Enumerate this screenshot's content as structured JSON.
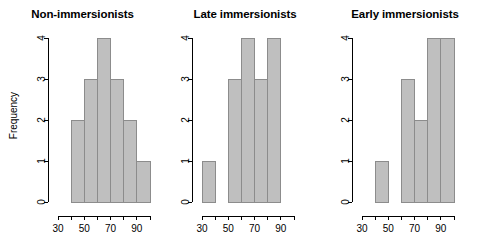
{
  "figure": {
    "width": 485,
    "height": 246,
    "background": "#ffffff",
    "bar_fill": "#bfbfbf",
    "bar_border": "#8c8c8c",
    "axis_color": "#000000"
  },
  "chart_data": [
    {
      "type": "bar",
      "title": "Non-immersionists",
      "xlabel": "",
      "ylabel": "Frequency",
      "xlim": [
        30,
        100
      ],
      "ylim": [
        0,
        4
      ],
      "grid": false,
      "legend": "none",
      "bin_width": 10,
      "bin_edges": [
        30,
        40,
        50,
        60,
        70,
        80,
        90,
        100
      ],
      "categories": [
        "30-40",
        "40-50",
        "50-60",
        "60-70",
        "70-80",
        "80-90",
        "90-100"
      ],
      "values": [
        0,
        2,
        3,
        4,
        3,
        2,
        1
      ],
      "xticks": [
        30,
        40,
        50,
        60,
        70,
        80,
        90,
        100
      ],
      "xticklabels": [
        "30",
        "",
        "50",
        "",
        "70",
        "",
        "90",
        ""
      ],
      "yticks": [
        0,
        1,
        2,
        3,
        4
      ],
      "yticklabels": [
        "0",
        "1",
        "2",
        "3",
        "4"
      ]
    },
    {
      "type": "bar",
      "title": "Late immersionists",
      "xlabel": "",
      "ylabel": "",
      "xlim": [
        30,
        100
      ],
      "ylim": [
        0,
        4
      ],
      "grid": false,
      "legend": "none",
      "bin_width": 10,
      "bin_edges": [
        30,
        40,
        50,
        60,
        70,
        80,
        90,
        100
      ],
      "categories": [
        "30-40",
        "40-50",
        "50-60",
        "60-70",
        "70-80",
        "80-90",
        "90-100"
      ],
      "values": [
        1,
        0,
        3,
        4,
        3,
        4,
        0
      ],
      "xticks": [
        30,
        40,
        50,
        60,
        70,
        80,
        90,
        100
      ],
      "xticklabels": [
        "30",
        "",
        "50",
        "",
        "70",
        "",
        "90",
        ""
      ],
      "yticks": [
        0,
        1,
        2,
        3,
        4
      ],
      "yticklabels": [
        "0",
        "1",
        "2",
        "3",
        "4"
      ]
    },
    {
      "type": "bar",
      "title": "Early immersionists",
      "xlabel": "",
      "ylabel": "",
      "xlim": [
        30,
        100
      ],
      "ylim": [
        0,
        4
      ],
      "grid": false,
      "legend": "none",
      "bin_width": 10,
      "bin_edges": [
        30,
        40,
        50,
        60,
        70,
        80,
        90,
        100
      ],
      "categories": [
        "30-40",
        "40-50",
        "50-60",
        "60-70",
        "70-80",
        "80-90",
        "90-100"
      ],
      "values": [
        0,
        1,
        0,
        3,
        2,
        4,
        4
      ],
      "xticks": [
        30,
        40,
        50,
        60,
        70,
        80,
        90,
        100
      ],
      "xticklabels": [
        "30",
        "",
        "50",
        "",
        "70",
        "",
        "90",
        ""
      ],
      "yticks": [
        0,
        1,
        2,
        3,
        4
      ],
      "yticklabels": [
        "0",
        "1",
        "2",
        "3",
        "4"
      ]
    }
  ]
}
